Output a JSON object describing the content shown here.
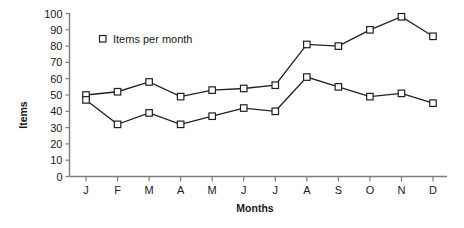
{
  "chart_data": {
    "type": "line",
    "title": "",
    "xlabel": "Months",
    "ylabel": "Items",
    "categories": [
      "J",
      "F",
      "M",
      "A",
      "M",
      "J",
      "J",
      "A",
      "S",
      "O",
      "N",
      "D"
    ],
    "series": [
      {
        "name": "Items per month",
        "values": [
          50,
          52,
          58,
          49,
          53,
          54,
          56,
          81,
          80,
          90,
          98,
          86
        ]
      },
      {
        "name": "Items per month",
        "values": [
          47,
          32,
          39,
          32,
          37,
          42,
          40,
          61,
          55,
          49,
          51,
          45
        ]
      }
    ],
    "ylim": [
      0,
      100
    ],
    "y_ticks": [
      0,
      10,
      20,
      30,
      40,
      50,
      60,
      70,
      80,
      90,
      100
    ],
    "grid": false,
    "legend": {
      "position": "top-left-inside",
      "entries": [
        {
          "label": "Items per month",
          "marker": "open-square"
        }
      ]
    },
    "colors": {
      "line": "#20201f",
      "marker_fill": "#ffffff",
      "marker_stroke": "#20201f",
      "axis": "#7d7d7d",
      "text": "#1a1a1a",
      "background": "#ffffff"
    }
  }
}
